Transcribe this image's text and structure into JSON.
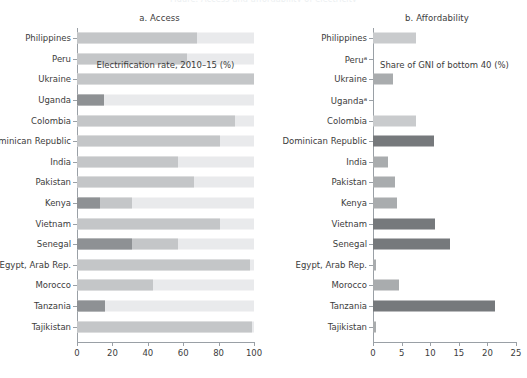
{
  "figure": {
    "cut_title": "Figure. Access and affordability of electricity",
    "panels": [
      {
        "id": "access",
        "title": "a. Access",
        "axis_title": "Electrification rate, 2010–15 (%)"
      },
      {
        "id": "affordability",
        "title": "b. Affordability",
        "axis_title": "Share of GNI of bottom 40 (%)"
      }
    ]
  },
  "chart_data": [
    {
      "type": "bar",
      "orientation": "horizontal",
      "title": "a. Access",
      "xlabel": "Electrification rate, 2010–15 (%)",
      "ylabel": "",
      "xlim": [
        0,
        100
      ],
      "xticks": [
        0,
        20,
        40,
        60,
        80,
        100
      ],
      "xticklabels": [
        "0",
        "20",
        "40",
        "60",
        "80",
        "100"
      ],
      "grid": false,
      "legend": "none",
      "track_max": 100,
      "categories": [
        "Philippines",
        "Peru",
        "Ukraine",
        "Uganda",
        "Colombia",
        "Dominican Republic",
        "India",
        "Pakistan",
        "Kenya",
        "Vietnam",
        "Senegal",
        "Egypt, Arab Rep.",
        "Morocco",
        "Tanzania",
        "Tajikistan"
      ],
      "series": [
        {
          "name": "Electrification rate",
          "values": [
            68,
            62,
            100,
            15,
            89,
            81,
            57,
            66,
            31,
            81,
            57,
            98,
            43,
            16,
            99
          ]
        },
        {
          "name": "Low-access segment",
          "values": [
            0,
            0,
            0,
            15,
            0,
            0,
            0,
            0,
            13,
            0,
            31,
            0,
            0,
            16,
            0
          ]
        }
      ]
    },
    {
      "type": "bar",
      "orientation": "horizontal",
      "title": "b. Affordability",
      "xlabel": "Share of GNI of bottom 40 (%)",
      "ylabel": "",
      "xlim": [
        0,
        25
      ],
      "xticks": [
        0,
        5,
        10,
        15,
        20,
        25
      ],
      "xticklabels": [
        "0",
        "5",
        "10",
        "15",
        "20",
        "25"
      ],
      "grid": false,
      "legend": "none",
      "categories": [
        "Philippines",
        "Peruᵃ",
        "Ukraine",
        "Ugandaᵃ",
        "Colombia",
        "Dominican Republic",
        "India",
        "Pakistan",
        "Kenya",
        "Vietnam",
        "Senegal",
        "Egypt, Arab Rep.",
        "Morocco",
        "Tanzania",
        "Tajikistan"
      ],
      "series": [
        {
          "name": "Share of GNI of bottom 40",
          "values": [
            7.5,
            0,
            3.5,
            0,
            7.6,
            10.6,
            2.6,
            3.9,
            4.2,
            10.8,
            13.4,
            0.5,
            4.6,
            21.3,
            0.6
          ]
        }
      ]
    }
  ],
  "rows": [
    {
      "label": "Philippines",
      "label_b": "Peru",
      "access_total": 68,
      "access_dark": 0,
      "afford": 7.5
    },
    {
      "label": "Peru",
      "access_total": 62,
      "access_dark": 0,
      "afford": 0
    },
    {
      "label": "Ukraine",
      "access_total": 100,
      "access_dark": 0,
      "afford": 3.5
    },
    {
      "label": "Uganda",
      "access_total": 15,
      "access_dark": 15,
      "afford": 0
    },
    {
      "label": "Colombia",
      "access_total": 89,
      "access_dark": 0,
      "afford": 7.6
    },
    {
      "label": "Dominican Republic",
      "access_total": 81,
      "access_dark": 0,
      "afford": 10.6
    },
    {
      "label": "India",
      "access_total": 57,
      "access_dark": 0,
      "afford": 2.6
    },
    {
      "label": "Pakistan",
      "access_total": 66,
      "access_dark": 0,
      "afford": 3.9
    },
    {
      "label": "Kenya",
      "access_total": 31,
      "access_dark": 13,
      "afford": 4.2
    },
    {
      "label": "Vietnam",
      "access_total": 81,
      "access_dark": 0,
      "afford": 10.8
    },
    {
      "label": "Senegal",
      "access_total": 57,
      "access_dark": 31,
      "afford": 13.4
    },
    {
      "label": "Egypt, Arab Rep.",
      "access_total": 98,
      "access_dark": 0,
      "afford": 0.5
    },
    {
      "label": "Morocco",
      "access_total": 43,
      "access_dark": 0,
      "afford": 4.6
    },
    {
      "label": "Tanzania",
      "access_total": 16,
      "access_dark": 16,
      "afford": 21.3
    },
    {
      "label": "Tajikistan",
      "access_total": 99,
      "access_dark": 0,
      "afford": 0.6
    }
  ],
  "labels_b": [
    {
      "text": "Philippines",
      "sup": ""
    },
    {
      "text": "Peru",
      "sup": "a"
    },
    {
      "text": "Ukraine",
      "sup": ""
    },
    {
      "text": "Uganda",
      "sup": "a"
    },
    {
      "text": "Colombia",
      "sup": ""
    },
    {
      "text": "Dominican Republic",
      "sup": ""
    },
    {
      "text": "India",
      "sup": ""
    },
    {
      "text": "Pakistan",
      "sup": ""
    },
    {
      "text": "Kenya",
      "sup": ""
    },
    {
      "text": "Vietnam",
      "sup": ""
    },
    {
      "text": "Senegal",
      "sup": ""
    },
    {
      "text": "Egypt, Arab Rep.",
      "sup": ""
    },
    {
      "text": "Morocco",
      "sup": ""
    },
    {
      "text": "Tanzania",
      "sup": ""
    },
    {
      "text": "Tajikistan",
      "sup": ""
    }
  ],
  "colors": {
    "track": "#e9eaec",
    "bar_light": "#c4c6c8",
    "bar_dark": "#8e9194",
    "axis": "#9aa0a6",
    "text": "#3c3c3c"
  }
}
